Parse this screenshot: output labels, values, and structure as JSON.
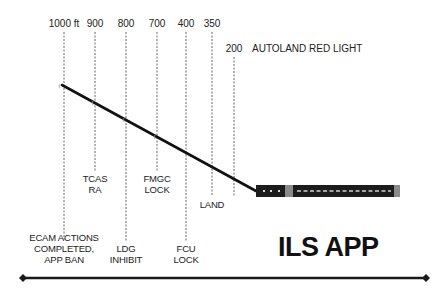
{
  "diagram": {
    "title": "ILS APP",
    "altitude_markers": [
      {
        "label": "1000 ft",
        "x": 64
      },
      {
        "label": "900",
        "x": 95
      },
      {
        "label": "800",
        "x": 126
      },
      {
        "label": "700",
        "x": 157
      },
      {
        "label": "400",
        "x": 186
      },
      {
        "label": "350",
        "x": 212
      },
      {
        "label": "200",
        "x": 234
      }
    ],
    "autoland_label": "AUTOLAND RED LIGHT",
    "events": {
      "ecam": [
        "ECAM ACTIONS",
        "COMPLETED,",
        "APP BAN"
      ],
      "tcas": [
        "TCAS",
        "RA"
      ],
      "ldg": [
        "LDG",
        "INHIBIT"
      ],
      "fmgc": [
        "FMGC",
        "LOCK"
      ],
      "fcu": [
        "FCU",
        "LOCK"
      ],
      "land": [
        "LAND"
      ]
    },
    "colors": {
      "line": "#111111",
      "runway": "#1c1c1c",
      "runway_threshold": "#8a8a8a",
      "dash": "#666666"
    }
  }
}
